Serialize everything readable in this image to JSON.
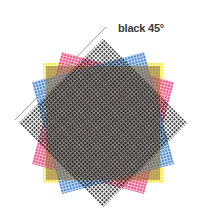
{
  "diagram": {
    "label": "black 45°",
    "center": [
      103,
      123
    ],
    "screens": [
      {
        "name": "yellow",
        "angle": 0,
        "side": 120,
        "color": "#f5e632",
        "opacity": 0.85
      },
      {
        "name": "magenta",
        "angle": 15,
        "side": 116,
        "color": "#e8306e",
        "opacity": 0.8
      },
      {
        "name": "cyan",
        "angle": -15,
        "side": 116,
        "color": "#2f74c8",
        "opacity": 0.8
      },
      {
        "name": "black",
        "angle": 45,
        "side": 119,
        "color": "#1a1a1a",
        "opacity": 0.85
      }
    ],
    "guide_line": {
      "x1": 15,
      "y1": 120,
      "x2": 106,
      "y2": 27,
      "color": "#999999"
    }
  }
}
